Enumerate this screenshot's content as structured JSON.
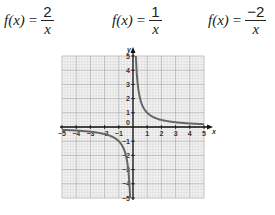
{
  "formulas": [
    {
      "lhs": "f(x)",
      "eq": "=",
      "numerator": "2",
      "denominator": "x"
    },
    {
      "lhs": "f(x)",
      "eq": "=",
      "numerator": "1",
      "denominator": "x"
    },
    {
      "lhs": "f(x)",
      "eq": "=",
      "numerator": "−2",
      "denominator": "x"
    }
  ],
  "chart_data": {
    "type": "line",
    "title": "",
    "xlabel": "x",
    "ylabel": "y",
    "xlim": [
      -5,
      5
    ],
    "ylim": [
      -5,
      5
    ],
    "grid": true,
    "x_ticks": [
      -5,
      -4,
      -3,
      -2,
      -1,
      1,
      2,
      3,
      4,
      5
    ],
    "y_ticks": [
      -5,
      -4,
      -3,
      -2,
      -1,
      1,
      2,
      3,
      4,
      5
    ],
    "origin_label": "0",
    "series": [
      {
        "name": "f(x) = 1/x",
        "function": "1/x",
        "x": [
          -5,
          -4,
          -3,
          -2,
          -1,
          -0.5,
          -0.25,
          -0.2,
          0.2,
          0.25,
          0.5,
          1,
          2,
          3,
          4,
          5
        ],
        "y": [
          -0.2,
          -0.25,
          -0.33,
          -0.5,
          -1,
          -2,
          -4,
          -5,
          5,
          4,
          2,
          1,
          0.5,
          0.33,
          0.25,
          0.2
        ]
      }
    ],
    "curve_color": "#666666"
  }
}
